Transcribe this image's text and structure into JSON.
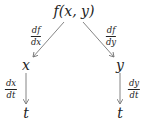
{
  "diagram": {
    "type": "chain-rule-tree",
    "colors": {
      "text": "#222222",
      "arrow": "#777777",
      "background": "#ffffff"
    },
    "nodes": {
      "root": {
        "label": "f(x, y)",
        "x": 74,
        "y": 11
      },
      "x": {
        "label": "x",
        "x": 26,
        "y": 65
      },
      "y": {
        "label": "y",
        "x": 120,
        "y": 65
      },
      "t_left": {
        "label": "t",
        "x": 26,
        "y": 113
      },
      "t_right": {
        "label": "t",
        "x": 120,
        "y": 113
      }
    },
    "edges": {
      "root_to_x": {
        "num": "df",
        "den": "dx",
        "label_x": 36,
        "label_y": 36
      },
      "root_to_y": {
        "num": "df",
        "den": "dy",
        "label_x": 111,
        "label_y": 36
      },
      "x_to_t": {
        "num": "dx",
        "den": "dt",
        "label_x": 10,
        "label_y": 89
      },
      "y_to_t": {
        "num": "dy",
        "den": "dt",
        "label_x": 134,
        "label_y": 89
      }
    }
  }
}
